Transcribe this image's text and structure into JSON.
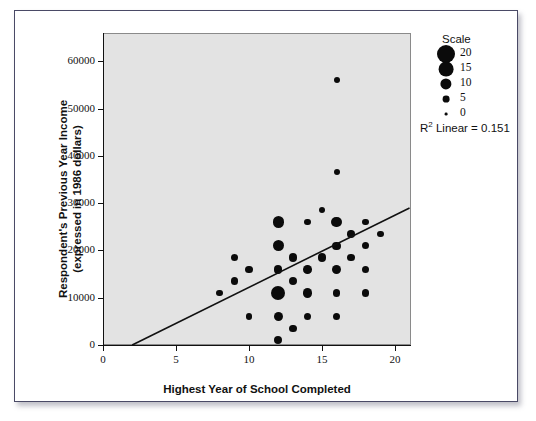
{
  "chart_data": {
    "type": "scatter",
    "title": "",
    "xlabel": "Highest Year of School Completed",
    "ylabel": "Respondent's Previous Year Income (expressed in 1986 dollars)",
    "ylabel_line1": "Respondent's Previous Year Income",
    "ylabel_line2": "(expressed in 1986 dollars)",
    "xlim": [
      0,
      21.1
    ],
    "ylim": [
      0,
      66000
    ],
    "xticks": [
      0,
      5,
      10,
      15,
      20
    ],
    "xtick_labels": [
      "0",
      "5",
      "10",
      "15",
      "20"
    ],
    "yticks": [
      0,
      10000,
      20000,
      30000,
      40000,
      50000,
      60000
    ],
    "ytick_labels": [
      "0",
      "10000",
      "20000",
      "30000",
      "40000",
      "50000",
      "60000"
    ],
    "grid": false,
    "plot_background": "#e3e3e3",
    "marker_color": "#0b0b0b",
    "size_encoding": "count",
    "annotation": "R² Linear = 0.151",
    "annotation_prefix": "R",
    "annotation_superscript": "2",
    "annotation_suffix": " Linear = 0.151",
    "trendline": {
      "type": "linear",
      "x_start": 2.0,
      "y_start": 0,
      "x_end": 21.0,
      "y_end": 29000
    },
    "legend": {
      "title": "Scale",
      "position": "top-right",
      "entries": [
        {
          "label": "20",
          "value": 20
        },
        {
          "label": "15",
          "value": 15
        },
        {
          "label": "10",
          "value": 10
        },
        {
          "label": "5",
          "value": 5
        },
        {
          "label": "0",
          "value": 0
        }
      ]
    },
    "points": [
      {
        "x": 16,
        "y": 56000,
        "size": 2
      },
      {
        "x": 16,
        "y": 36500,
        "size": 2
      },
      {
        "x": 15,
        "y": 28500,
        "size": 2
      },
      {
        "x": 12,
        "y": 26000,
        "size": 12
      },
      {
        "x": 14,
        "y": 26000,
        "size": 3
      },
      {
        "x": 16,
        "y": 26000,
        "size": 10
      },
      {
        "x": 18,
        "y": 26000,
        "size": 3
      },
      {
        "x": 17,
        "y": 23500,
        "size": 4
      },
      {
        "x": 19,
        "y": 23500,
        "size": 3
      },
      {
        "x": 12,
        "y": 21000,
        "size": 11
      },
      {
        "x": 16,
        "y": 21000,
        "size": 5
      },
      {
        "x": 18,
        "y": 21000,
        "size": 4
      },
      {
        "x": 9,
        "y": 18500,
        "size": 4
      },
      {
        "x": 13,
        "y": 18500,
        "size": 5
      },
      {
        "x": 15,
        "y": 18500,
        "size": 5
      },
      {
        "x": 17,
        "y": 18500,
        "size": 4
      },
      {
        "x": 10,
        "y": 16000,
        "size": 4
      },
      {
        "x": 12,
        "y": 16000,
        "size": 6
      },
      {
        "x": 14,
        "y": 16000,
        "size": 6
      },
      {
        "x": 16,
        "y": 16000,
        "size": 7
      },
      {
        "x": 18,
        "y": 16000,
        "size": 4
      },
      {
        "x": 9,
        "y": 13500,
        "size": 4
      },
      {
        "x": 13,
        "y": 13500,
        "size": 5
      },
      {
        "x": 8,
        "y": 11000,
        "size": 3
      },
      {
        "x": 12,
        "y": 11000,
        "size": 21
      },
      {
        "x": 14,
        "y": 11000,
        "size": 7
      },
      {
        "x": 16,
        "y": 11000,
        "size": 4
      },
      {
        "x": 18,
        "y": 11000,
        "size": 4
      },
      {
        "x": 10,
        "y": 6000,
        "size": 3
      },
      {
        "x": 12,
        "y": 6000,
        "size": 7
      },
      {
        "x": 14,
        "y": 6000,
        "size": 4
      },
      {
        "x": 16,
        "y": 6000,
        "size": 4
      },
      {
        "x": 13,
        "y": 3500,
        "size": 4
      },
      {
        "x": 12,
        "y": 1000,
        "size": 5
      }
    ]
  }
}
